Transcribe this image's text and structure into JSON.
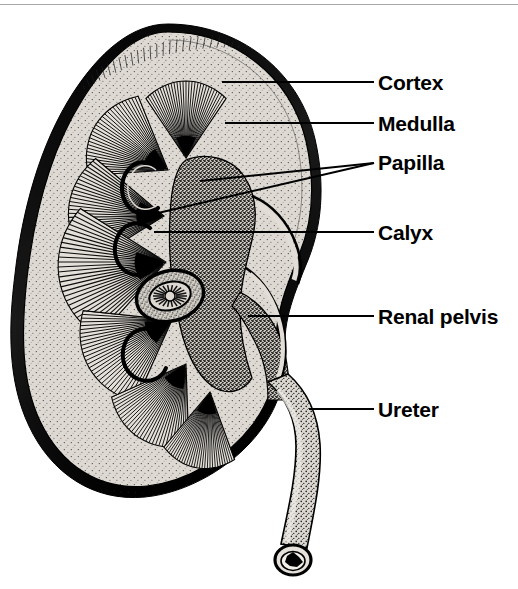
{
  "figure": {
    "background_color": "#ffffff",
    "ink_color": "#000000",
    "parenchyma_fill": "#dedad3",
    "rule_color": "#a8a8a8"
  },
  "labels": [
    {
      "id": "cortex",
      "text": "Cortex",
      "x": 378,
      "y": 72,
      "leader": {
        "type": "straight",
        "from_x": 222,
        "from_y": 82,
        "to_x": 374,
        "to_y": 82
      }
    },
    {
      "id": "medulla",
      "text": "Medulla",
      "x": 378,
      "y": 113,
      "leader": {
        "type": "straight",
        "from_x": 225,
        "from_y": 123,
        "to_x": 374,
        "to_y": 123
      }
    },
    {
      "id": "papilla",
      "text": "Papilla",
      "x": 378,
      "y": 152,
      "leader": {
        "type": "forked",
        "junction_x": 374,
        "junction_y": 163,
        "branches": [
          {
            "to_x": 200,
            "to_y": 181
          },
          {
            "to_x": 158,
            "to_y": 213
          }
        ]
      }
    },
    {
      "id": "calyx",
      "text": "Calyx",
      "x": 378,
      "y": 222,
      "leader": {
        "type": "straight",
        "from_x": 154,
        "from_y": 232,
        "to_x": 374,
        "to_y": 232
      }
    },
    {
      "id": "renal-pelvis",
      "text": "Renal pelvis",
      "x": 378,
      "y": 306,
      "leader": {
        "type": "straight",
        "from_x": 248,
        "from_y": 316,
        "to_x": 374,
        "to_y": 316
      }
    },
    {
      "id": "ureter",
      "text": "Ureter",
      "x": 378,
      "y": 399,
      "leader": {
        "type": "straight",
        "from_x": 309,
        "from_y": 409,
        "to_x": 374,
        "to_y": 409
      }
    }
  ],
  "structures": {
    "capsule": "outer dark hatched rim of kidney",
    "cortex": "pale stippled outer band",
    "pyramids": "fan-shaped striated medullary pyramids",
    "papillae": "dark apex tips of pyramids",
    "calyces": "cup-shaped collecting chambers around papillae",
    "renal_pelvis": "dense stippled funnel at hilum",
    "ureter": "stippled tube descending from hilum",
    "ureter_lumen": "dark stellate cut lumen at ureter end"
  },
  "pyramid_count": 7
}
